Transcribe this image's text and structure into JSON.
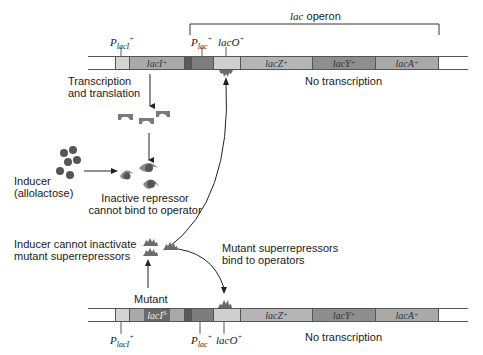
{
  "top": {
    "operon_label_italic": "lac",
    "operon_label": " operon",
    "p_laci_label": "P",
    "p_laci_sub": "lacI",
    "p_laci_sup": "+",
    "p_lac_label": "P",
    "p_lac_sub": "lac",
    "p_lac_sup": "+",
    "laco_label": "lacO",
    "laco_sup": "+",
    "genes": [
      {
        "name": "lacI",
        "sup": "+"
      },
      {
        "name": "lacZ",
        "sup": "+"
      },
      {
        "name": "lacY",
        "sup": "+"
      },
      {
        "name": "lacA",
        "sup": "+"
      }
    ],
    "status": "No transcription"
  },
  "middle": {
    "transcription_line1": "Transcription",
    "transcription_line2": "and translation",
    "inducer_line1": "Inducer",
    "inducer_line2": "(allolactose)",
    "inactive_line1": "Inactive repressor",
    "inactive_line2": "cannot bind to operator",
    "cannot_line1": "Inducer cannot inactivate",
    "cannot_line2": "mutant superrepressors",
    "bind_line1": "Mutant superrepressors",
    "bind_line2": "bind to operators",
    "mutant_label": "Mutant"
  },
  "bottom": {
    "laci_s_name": "lacI",
    "laci_s_sup": "S",
    "p_laci_label": "P",
    "p_laci_sub": "lacI",
    "p_laci_sup": "+",
    "p_lac_label": "P",
    "p_lac_sub": "lac",
    "p_lac_sup": "+",
    "laco_label": "lacO",
    "laco_sup": "+",
    "genes": [
      {
        "name": "lacZ",
        "sup": "+"
      },
      {
        "name": "lacY",
        "sup": "+"
      },
      {
        "name": "lacA",
        "sup": "+"
      }
    ],
    "status": "No transcription"
  },
  "colors": {
    "p_laci": "#d4d4d4",
    "laci": "#a9a9a9",
    "spacer": "#5a5a5a",
    "p_lac": "#7d7d7d",
    "laco": "#cfcfcf",
    "lacz": "#b5b5b5",
    "lacy": "#8e8e8e",
    "laca": "#a9a9a9",
    "repressor": "#7a7a7a",
    "inducer": "#555555",
    "laci_s_box": "#6a6a6a"
  }
}
